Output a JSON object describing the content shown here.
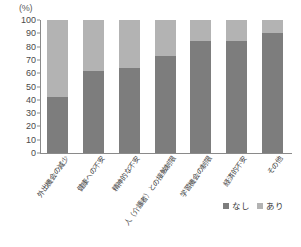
{
  "chart_data": {
    "type": "bar",
    "subtype": "stacked-100-percent",
    "title": "",
    "xlabel": "",
    "ylabel": "",
    "unit_label": "(%)",
    "ylim": [
      0,
      100
    ],
    "yticks": [
      0,
      10,
      20,
      30,
      40,
      50,
      60,
      70,
      80,
      90,
      100
    ],
    "ytick_labels": [
      "0",
      "10",
      "20",
      "30",
      "40",
      "50",
      "60",
      "70",
      "80",
      "90",
      "100"
    ],
    "grid": false,
    "legend_position": "bottom-right",
    "categories": [
      "外出機会の減少",
      "健康への不安",
      "精神的な不安",
      "人（介護者）との接触制限",
      "学習機会の制限",
      "経済的不安",
      "その他"
    ],
    "series": [
      {
        "name": "なし",
        "color": "#7d7d7d",
        "values": [
          42,
          62,
          64,
          73,
          84,
          84,
          90
        ]
      },
      {
        "name": "あり",
        "color": "#b3b3b3",
        "values": [
          58,
          38,
          36,
          27,
          16,
          16,
          10
        ]
      }
    ]
  },
  "legend": {
    "items": [
      {
        "label": "なし",
        "color": "#7d7d7d"
      },
      {
        "label": "あり",
        "color": "#b3b3b3"
      }
    ]
  },
  "colors": {
    "series_nashi": "#7d7d7d",
    "series_ari": "#b3b3b3",
    "axis": "#8a8a8a",
    "text": "#3c3c3c",
    "background": "#ffffff"
  }
}
